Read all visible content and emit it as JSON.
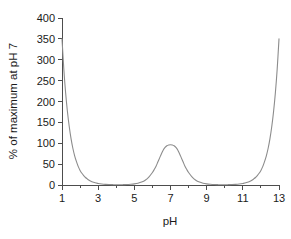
{
  "chart_data": {
    "type": "line",
    "title": "",
    "subtitle": "",
    "xlabel": "pH",
    "ylabel": "% of maximum at pH 7",
    "xlim": [
      1,
      13
    ],
    "ylim": [
      0,
      400
    ],
    "grid": false,
    "legend": null,
    "legend_position": "none",
    "line_color": "#8c8c8c",
    "axis_color": "#4d4d4d",
    "background_color": "#ffffff",
    "x_ticks_major": [
      1,
      3,
      5,
      7,
      9,
      11,
      13
    ],
    "x_tick_labels": [
      "1",
      "3",
      "5",
      "7",
      "9",
      "11",
      "13"
    ],
    "x_ticks_minor": [
      2,
      4,
      6,
      8,
      10,
      12
    ],
    "y_ticks_major": [
      0,
      50,
      100,
      150,
      200,
      250,
      300,
      350,
      400
    ],
    "y_tick_labels": [
      "0",
      "50",
      "100",
      "150",
      "200",
      "250",
      "300",
      "350",
      "400"
    ],
    "y_ticks_minor": [],
    "annotations": [],
    "series": [
      {
        "name": "relative activity",
        "x": [
          1.0,
          1.1,
          1.2,
          1.3,
          1.4,
          1.5,
          1.6,
          1.7,
          1.8,
          1.9,
          2.0,
          2.1,
          2.2,
          2.3,
          2.4,
          2.5,
          2.6,
          2.7,
          2.8,
          2.9,
          3.0,
          3.2,
          3.4,
          3.6,
          3.8,
          4.0,
          4.2,
          4.4,
          4.6,
          4.8,
          5.0,
          5.2,
          5.4,
          5.6,
          5.8,
          6.0,
          6.1,
          6.2,
          6.3,
          6.4,
          6.5,
          6.6,
          6.7,
          6.8,
          6.9,
          7.0,
          7.1,
          7.2,
          7.3,
          7.4,
          7.5,
          7.6,
          7.7,
          7.8,
          7.9,
          8.0,
          8.2,
          8.4,
          8.6,
          8.8,
          9.0,
          9.2,
          9.4,
          9.6,
          9.8,
          10.0,
          10.2,
          10.4,
          10.6,
          10.8,
          11.0,
          11.1,
          11.2,
          11.3,
          11.4,
          11.5,
          11.6,
          11.7,
          11.8,
          11.9,
          12.0,
          12.1,
          12.2,
          12.3,
          12.4,
          12.5,
          12.6,
          12.7,
          12.8,
          12.9,
          13.0
        ],
        "y": [
          350.0,
          278.0,
          221.0,
          176.0,
          140.0,
          111.0,
          88.0,
          70.0,
          56.0,
          44.0,
          35.0,
          28.0,
          22.5,
          18.0,
          14.5,
          11.5,
          9.2,
          7.3,
          5.9,
          4.7,
          3.7,
          2.4,
          1.6,
          1.1,
          0.8,
          0.6,
          0.6,
          0.8,
          1.1,
          1.7,
          2.6,
          4.2,
          7.0,
          11.5,
          19.0,
          30.0,
          37.0,
          45.0,
          55.0,
          65.0,
          75.0,
          84.0,
          90.0,
          94.0,
          96.0,
          96.5,
          96.0,
          94.0,
          90.0,
          84.0,
          75.0,
          65.0,
          55.0,
          45.0,
          37.0,
          30.0,
          19.0,
          11.5,
          7.0,
          4.2,
          2.6,
          1.7,
          1.1,
          0.8,
          0.6,
          0.6,
          0.8,
          1.1,
          1.6,
          2.4,
          3.7,
          4.7,
          5.9,
          7.3,
          9.2,
          11.5,
          14.5,
          18.0,
          22.5,
          28.0,
          35.0,
          44.0,
          56.0,
          70.0,
          88.0,
          111.0,
          140.0,
          176.0,
          221.0,
          278.0,
          350.0
        ]
      }
    ]
  }
}
